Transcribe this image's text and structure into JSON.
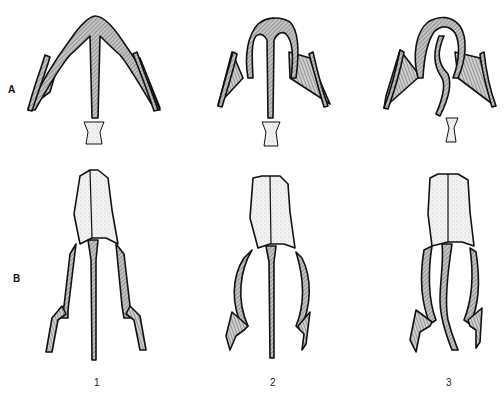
{
  "row_labels": {
    "a": "A",
    "b": "B"
  },
  "column_labels": {
    "c1": "1",
    "c2": "2",
    "c3": "3"
  },
  "colors": {
    "outline": "#111111",
    "hatch_fill": "#bcbcbc",
    "stipple_fill": "#eeeeee",
    "background": "#ffffff"
  }
}
